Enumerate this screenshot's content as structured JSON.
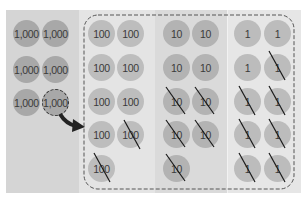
{
  "columns": [
    {
      "name": "thousands",
      "label": "1,000",
      "discs": [
        {
          "row": 0,
          "col": 0,
          "crossed": false
        },
        {
          "row": 0,
          "col": 1,
          "crossed": false
        },
        {
          "row": 1,
          "col": 0,
          "crossed": false
        },
        {
          "row": 1,
          "col": 1,
          "crossed": false
        },
        {
          "row": 2,
          "col": 0,
          "crossed": false
        },
        {
          "row": 2,
          "col": 1,
          "crossed": false,
          "moving": true
        }
      ]
    },
    {
      "name": "hundreds",
      "label": "100"
    },
    {
      "name": "tens",
      "label": "10"
    },
    {
      "name": "ones",
      "label": "1"
    }
  ],
  "labels": {
    "th": "1,000",
    "hu": "100",
    "te": "10",
    "on": "1"
  },
  "arrow": {
    "from": "thousands",
    "to": "hundreds",
    "meaning": "regroup 1,000 as ten 100s"
  },
  "colors": {
    "dashed_border": "#555555",
    "arrow": "#222222"
  }
}
